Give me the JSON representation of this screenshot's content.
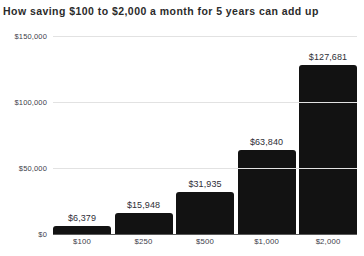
{
  "chart_data": {
    "type": "bar",
    "title": "How saving $100 to $2,000 a month for 5 years can add up",
    "xlabel": "",
    "ylabel": "",
    "categories": [
      "$100",
      "$250",
      "$500",
      "$1,000",
      "$2,000"
    ],
    "values": [
      6379,
      15948,
      31935,
      63840,
      127681
    ],
    "value_labels": [
      "$6,379",
      "$15,948",
      "$31,935",
      "$63,840",
      "$127,681"
    ],
    "ylim": [
      0,
      150000
    ],
    "yticks": [
      0,
      50000,
      100000,
      150000
    ],
    "ytick_labels": [
      "$0",
      "$50,000",
      "$100,000",
      "$150,000"
    ],
    "grid": true,
    "legend": false,
    "bar_color": "#121212",
    "gridline_color": "#e2e2e2",
    "axis_color": "#5a5a5a",
    "background_color": "#ffffff",
    "text_color": "#2e2e36"
  }
}
